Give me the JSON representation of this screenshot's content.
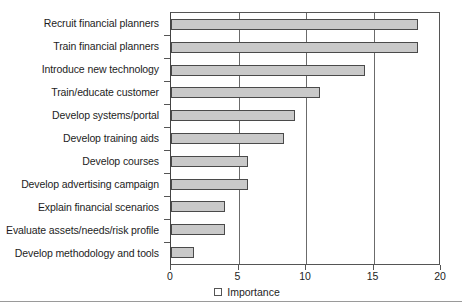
{
  "chart_data": {
    "type": "bar",
    "orientation": "horizontal",
    "title": "",
    "xlabel": "",
    "ylabel": "",
    "xlim": [
      0,
      20
    ],
    "xticks": [
      0,
      5,
      10,
      15,
      20
    ],
    "grid": true,
    "legend": {
      "position": "bottom",
      "entries": [
        {
          "label": "Importance",
          "swatch": "legend-swatch-icon",
          "color": "#c9c9c9"
        }
      ]
    },
    "categories": [
      "Recruit financial planners",
      "Train financial planners",
      "Introduce new technology",
      "Train/educate customer",
      "Develop systems/portal",
      "Develop training aids",
      "Develop courses",
      "Develop advertising campaign",
      "Explain financial scenarios",
      "Evaluate assets/needs/risk profile",
      "Develop methodology and tools"
    ],
    "series": [
      {
        "name": "Importance",
        "values": [
          18.3,
          18.3,
          14.4,
          11.0,
          9.2,
          8.4,
          5.7,
          5.7,
          4.0,
          4.0,
          1.7
        ]
      }
    ]
  },
  "style": {
    "bar_fill": "#c9c9c9",
    "bar_stroke": "#4a4a4a",
    "axis_color": "#555555",
    "text_color": "#1d1d1d",
    "background": "#ffffff"
  }
}
